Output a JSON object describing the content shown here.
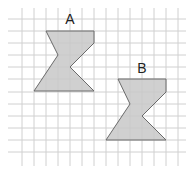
{
  "diagram": {
    "type": "grid-shapes",
    "grid": {
      "x_lines": [
        22,
        34,
        46,
        58,
        70,
        82,
        94,
        106,
        118,
        130,
        142,
        154,
        166,
        178
      ],
      "y_lines": [
        19,
        31,
        43,
        55,
        67,
        79,
        92,
        104,
        116,
        128,
        140,
        152
      ],
      "x_extent": [
        8,
        186
      ],
      "y_extent": [
        8,
        166
      ],
      "line_color": "#d0d0d0"
    },
    "shape_fill": "#c8c8c8",
    "shape_stroke": "#6a6a6a",
    "shapes": [
      {
        "label": "A",
        "label_pos": [
          70,
          24
        ],
        "points": "46,31 94,31 94,43 70,67 94,91 34,91 58,55"
      },
      {
        "label": "B",
        "label_pos": [
          142,
          73
        ],
        "points": "118,79 166,79 166,92 142,116 166,140 106,140 130,104"
      }
    ]
  }
}
